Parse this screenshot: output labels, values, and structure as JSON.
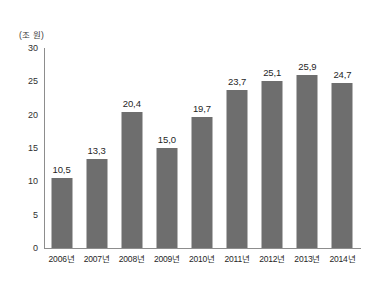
{
  "chart_data": {
    "type": "bar",
    "title": "",
    "subtitle": "",
    "xlabel": "",
    "ylabel": "",
    "unit_label": "(조 원)",
    "categories": [
      "2006년",
      "2007년",
      "2008년",
      "2009년",
      "2010년",
      "2011년",
      "2012년",
      "2013년",
      "2014년"
    ],
    "values": [
      10.5,
      13.3,
      20.4,
      15.0,
      19.7,
      23.7,
      25.1,
      25.9,
      24.7
    ],
    "value_labels": [
      "10,5",
      "13,3",
      "20,4",
      "15,0",
      "19,7",
      "23,7",
      "25,1",
      "25,9",
      "24,7"
    ],
    "ylim": [
      0,
      30
    ],
    "ytick_values": [
      0,
      5,
      10,
      15,
      20,
      25,
      30
    ],
    "ytick_labels": [
      "0",
      "5",
      "10",
      "15",
      "20",
      "25",
      "30"
    ],
    "grid": false,
    "legend": false,
    "legend_position": "none",
    "bar_color": "#6e6e6e",
    "axis_color": "#8d8d8d",
    "background_color": "#ffffff",
    "text_color": "#1f1f1f"
  }
}
